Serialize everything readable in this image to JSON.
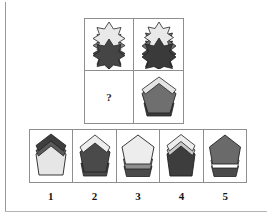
{
  "puzzle": {
    "type": "matrix-reasoning",
    "question_mark": "?",
    "matrix": {
      "rows": 2,
      "columns": 2,
      "cells": [
        {
          "position": "top-left",
          "figure": "stacked-star-triple",
          "description": "Three overlapping six-point stars stacked vertically: light top, medium-grey middle, dark bottom",
          "layers": [
            {
              "name": "top-star",
              "fill": "#e9e9e9"
            },
            {
              "name": "middle-star",
              "fill": "#8a8a8a"
            },
            {
              "name": "bottom-star",
              "fill": "#4b4b4b"
            }
          ]
        },
        {
          "position": "top-right",
          "figure": "stacked-star-double",
          "description": "Light top star over a large dark-grey star body",
          "layers": [
            {
              "name": "top-star",
              "fill": "#e9e9e9"
            },
            {
              "name": "body-star",
              "fill": "#6f6f6f"
            },
            {
              "name": "bottom-star",
              "fill": "#3f3f3f"
            }
          ]
        },
        {
          "position": "bottom-left",
          "figure": "question-mark",
          "description": "Empty cell containing a bold question mark",
          "layers": []
        },
        {
          "position": "bottom-right",
          "figure": "stacked-pentagon",
          "description": "Pentagon with a light chevron cap, grey body and dark base band",
          "layers": [
            {
              "name": "cap",
              "fill": "#e4e4e4"
            },
            {
              "name": "body",
              "fill": "#6f6f6f"
            },
            {
              "name": "base",
              "fill": "#3b3b3b"
            }
          ]
        }
      ]
    },
    "options": [
      {
        "label": "1",
        "name": "option-1",
        "description": "Dark chevron cap over a light pentagon body",
        "cap_fill": "#3e3e3e",
        "mid_fill": "#5a5a5a",
        "body_fill": "#e6e6e6"
      },
      {
        "label": "2",
        "name": "option-2",
        "description": "Light chevron cap over a dark pentagon body with dark base",
        "cap_fill": "#ededed",
        "mid_fill": "#6b6b6b",
        "body_fill": "#4a4a4a"
      },
      {
        "label": "3",
        "name": "option-3",
        "description": "Light pentagon body above grey and dark chevron bands",
        "cap_fill": "#ededed",
        "mid_fill": "#8e8e8e",
        "body_fill": "#4a4a4a"
      },
      {
        "label": "4",
        "name": "option-4",
        "description": "Light chevron cap over a dark pentagon body",
        "cap_fill": "#ededed",
        "mid_fill": "#c9c9c9",
        "body_fill": "#3d3d3d"
      },
      {
        "label": "5",
        "name": "option-5",
        "description": "Dark pentagon body over a white band and dark base",
        "cap_fill": "#6a6a6a",
        "mid_fill": "#ffffff",
        "body_fill": "#4a4a4a"
      }
    ]
  },
  "colors": {
    "page_background": "#ffffff",
    "frame_line": "#9a9a9a",
    "cell_border": "#8e8e8e",
    "outline": "#2a2a2a",
    "label_text": "#151515"
  }
}
